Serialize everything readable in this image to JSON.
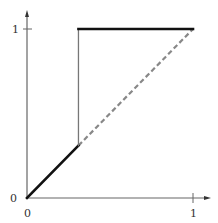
{
  "chart_data": {
    "type": "line",
    "title": "",
    "xlabel": "",
    "ylabel": "",
    "xlim": [
      0,
      1
    ],
    "ylim": [
      0,
      1
    ],
    "grid": false,
    "x_ticks": [
      "0",
      "1"
    ],
    "y_ticks": [
      "0",
      "1"
    ],
    "series": [
      {
        "name": "step function",
        "style": "solid-thick",
        "color": "#111111",
        "x": [
          0,
          0.31,
          0.31,
          1
        ],
        "y": [
          0,
          0.31,
          1,
          1
        ]
      },
      {
        "name": "diagonal",
        "style": "dashed",
        "color": "#888888",
        "x": [
          0.31,
          1
        ],
        "y": [
          0.31,
          1
        ]
      }
    ]
  },
  "labels": {
    "x0": "0",
    "x1": "1",
    "y0": "0",
    "y1": "1"
  }
}
